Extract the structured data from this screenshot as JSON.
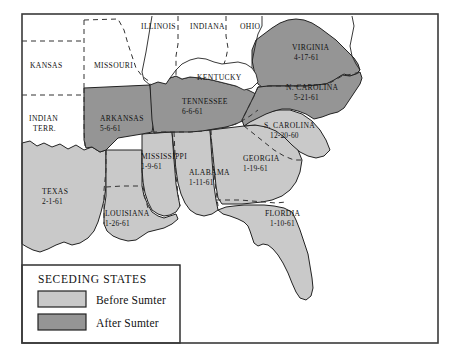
{
  "map": {
    "title": "Seceding States of the American Civil War",
    "frame": {
      "stroke": "#3a3a3a"
    },
    "colors": {
      "before_sumter": "#c9c9c9",
      "after_sumter": "#959595",
      "union_fill": "#ffffff",
      "outline": "#222222",
      "internal_border": "#333333",
      "background": "#ffffff"
    },
    "seceding_states": [
      {
        "name": "ARKANSAS",
        "date": "5-6-61",
        "group": "after_sumter",
        "label_x": 100,
        "label_y": 121,
        "date_x": 100,
        "date_y": 131
      },
      {
        "name": "TENNESSEE",
        "date": "6-6-61",
        "group": "after_sumter",
        "label_x": 185,
        "label_y": 104,
        "date_x": 185,
        "date_y": 114
      },
      {
        "name": "VIRGINIA",
        "date": "4-17-61",
        "group": "after_sumter",
        "label_x": 294,
        "label_y": 50,
        "date_x": 296,
        "date_y": 60
      },
      {
        "name": "N. CAROLINA",
        "date": "5-21-61",
        "group": "after_sumter",
        "label_x": 289,
        "label_y": 90,
        "date_x": 296,
        "date_y": 100
      },
      {
        "name": "S. CAROLINA",
        "date": "12-20-60",
        "group": "before_sumter",
        "label_x": 268,
        "label_y": 128,
        "date_x": 274,
        "date_y": 138
      },
      {
        "name": "MISSISSIPPI",
        "date": "1-9-61",
        "group": "before_sumter",
        "label_x": 143,
        "label_y": 159,
        "date_x": 143,
        "date_y": 169
      },
      {
        "name": "ALABAMA",
        "date": "1-11-61",
        "group": "before_sumter",
        "label_x": 191,
        "label_y": 175,
        "date_x": 191,
        "date_y": 185
      },
      {
        "name": "GEORGIA",
        "date": "1-19-61",
        "group": "before_sumter",
        "label_x": 245,
        "label_y": 161,
        "date_x": 245,
        "date_y": 171
      },
      {
        "name": "TEXAS",
        "date": "2-1-61",
        "group": "before_sumter",
        "label_x": 43,
        "label_y": 194,
        "date_x": 43,
        "date_y": 204
      },
      {
        "name": "LOUISIANA",
        "date": "1-26-61",
        "group": "before_sumter",
        "label_x": 107,
        "label_y": 216,
        "date_x": 107,
        "date_y": 226
      },
      {
        "name": "FLORDIA",
        "date": "1-10-61",
        "group": "before_sumter",
        "label_x": 268,
        "label_y": 216,
        "date_x": 272,
        "date_y": 226
      }
    ],
    "union_states": [
      {
        "name": "KANSAS",
        "date": "",
        "label_x": 32,
        "label_y": 68
      },
      {
        "name": "MISSOURI",
        "date": "",
        "label_x": 96,
        "label_y": 68
      },
      {
        "name": "ILLINOIS",
        "date": "",
        "label_x": 143,
        "label_y": 29
      },
      {
        "name": "INDIANA",
        "date": "",
        "label_x": 192,
        "label_y": 29
      },
      {
        "name": "OHIO",
        "date": "",
        "label_x": 243,
        "label_y": 29
      },
      {
        "name": "KENTUCKY",
        "date": "",
        "label_x": 199,
        "label_y": 80
      },
      {
        "name": "INDIAN",
        "date": "",
        "label_x": 30,
        "label_y": 121
      },
      {
        "name": "TERR.",
        "date": "",
        "label_x": 34,
        "label_y": 131
      }
    ],
    "legend": {
      "title": "SECEDING STATES",
      "items": [
        {
          "label": "Before Sumter",
          "swatch": "#c9c9c9"
        },
        {
          "label": "After Sumter",
          "swatch": "#959595"
        }
      ]
    }
  }
}
